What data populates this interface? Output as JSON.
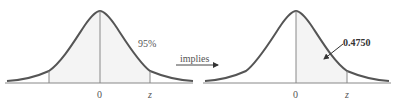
{
  "caption": "",
  "left_panel": {
    "label_percent": "95%",
    "tick_center": "0",
    "tick_right": "z",
    "shaded": "symmetric region from -z to z"
  },
  "connector": {
    "label": "implies"
  },
  "right_panel": {
    "label_area": "0.4750",
    "tick_center": "0",
    "tick_right": "z",
    "shaded": "region from 0 to z"
  },
  "colors": {
    "curve": "#555555",
    "axis": "#888888",
    "shade": "#f4f4f4"
  }
}
